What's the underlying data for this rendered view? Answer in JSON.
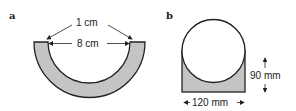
{
  "figures": [
    {
      "label": "a",
      "shape": "semicircular-ring",
      "annotations": {
        "thickness": "1 cm",
        "inner_width": "8 cm"
      }
    },
    {
      "label": "b",
      "shape": "circle-in-rectangle",
      "annotations": {
        "width": "120 mm",
        "height": "90 mm"
      }
    }
  ],
  "colors": {
    "fill": "#c4c4c4",
    "stroke": "#222222",
    "background": "#ffffff"
  }
}
